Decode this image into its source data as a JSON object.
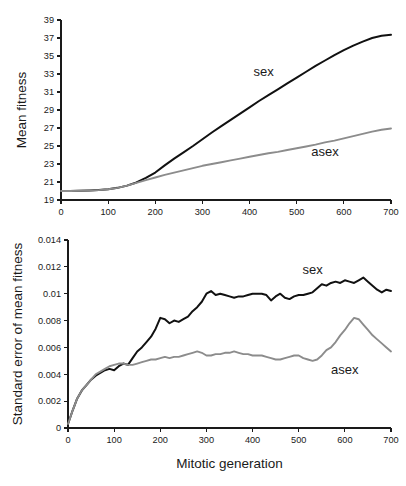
{
  "figure": {
    "name": "mean-fitness-and-standard-error-figure",
    "background_color": "#ffffff",
    "series_colors": {
      "sex": "#111111",
      "asex": "#8c8c8c"
    }
  },
  "chart_data": [
    {
      "panel": "top",
      "type": "line",
      "title": "",
      "xlabel": "",
      "ylabel": "Mean fitness",
      "xlim": [
        0,
        700
      ],
      "ylim": [
        19,
        39
      ],
      "xticks": [
        0,
        100,
        200,
        300,
        400,
        500,
        600,
        700
      ],
      "yticks": [
        19,
        21,
        23,
        25,
        27,
        29,
        31,
        33,
        35,
        37,
        39
      ],
      "xticklabels": [
        "0",
        "100",
        "200",
        "300",
        "400",
        "500",
        "600",
        "700"
      ],
      "yticklabels": [
        "19",
        "21",
        "23",
        "25",
        "27",
        "29",
        "31",
        "33",
        "35",
        "37",
        "39"
      ],
      "grid": false,
      "legend_position": "inline-annotation",
      "annotations": [
        {
          "text": "sex",
          "x": 430,
          "y": 33.2
        },
        {
          "text": "asex",
          "x": 560,
          "y": 24.3
        }
      ],
      "x": [
        0,
        20,
        40,
        60,
        80,
        100,
        120,
        140,
        160,
        180,
        200,
        220,
        240,
        260,
        280,
        300,
        320,
        340,
        360,
        380,
        400,
        420,
        440,
        460,
        480,
        500,
        520,
        540,
        560,
        580,
        600,
        620,
        640,
        660,
        680,
        700
      ],
      "series": [
        {
          "name": "sex",
          "color": "#111111",
          "values": [
            20.0,
            20.0,
            20.02,
            20.05,
            20.1,
            20.2,
            20.35,
            20.6,
            20.95,
            21.45,
            22.05,
            22.85,
            23.6,
            24.3,
            25.0,
            25.75,
            26.5,
            27.2,
            27.9,
            28.6,
            29.3,
            30.0,
            30.65,
            31.3,
            31.95,
            32.6,
            33.25,
            33.9,
            34.5,
            35.1,
            35.65,
            36.15,
            36.6,
            37.0,
            37.25,
            37.35
          ]
        },
        {
          "name": "asex",
          "color": "#8c8c8c",
          "values": [
            20.0,
            20.0,
            20.02,
            20.05,
            20.1,
            20.2,
            20.35,
            20.6,
            20.9,
            21.2,
            21.5,
            21.8,
            22.05,
            22.3,
            22.55,
            22.8,
            23.0,
            23.2,
            23.4,
            23.6,
            23.8,
            24.0,
            24.2,
            24.35,
            24.55,
            24.75,
            24.95,
            25.15,
            25.4,
            25.6,
            25.85,
            26.1,
            26.35,
            26.6,
            26.8,
            26.95
          ]
        }
      ]
    },
    {
      "panel": "bottom",
      "type": "line",
      "title": "",
      "xlabel": "Mitotic generation",
      "ylabel": "Standard error of mean fitness",
      "xlim": [
        0,
        700
      ],
      "ylim": [
        0,
        0.014
      ],
      "xticks": [
        0,
        100,
        200,
        300,
        400,
        500,
        600,
        700
      ],
      "yticks": [
        0,
        0.002,
        0.004,
        0.006,
        0.008,
        0.01,
        0.012,
        0.014
      ],
      "xticklabels": [
        "0",
        "100",
        "200",
        "300",
        "400",
        "500",
        "600",
        "700"
      ],
      "yticklabels": [
        "0",
        "0.002",
        "0.004",
        "0.006",
        "0.008",
        "0.01",
        "0.012",
        "0.014"
      ],
      "grid": false,
      "legend_position": "inline-annotation",
      "annotations": [
        {
          "text": "sex",
          "x": 530,
          "y": 0.01175
        },
        {
          "text": "asex",
          "x": 600,
          "y": 0.00435
        }
      ],
      "x": [
        0,
        10,
        20,
        30,
        40,
        50,
        60,
        70,
        80,
        90,
        100,
        110,
        120,
        130,
        140,
        150,
        160,
        170,
        180,
        190,
        200,
        210,
        220,
        230,
        240,
        250,
        260,
        270,
        280,
        290,
        300,
        310,
        320,
        330,
        340,
        350,
        360,
        370,
        380,
        390,
        400,
        410,
        420,
        430,
        440,
        450,
        460,
        470,
        480,
        490,
        500,
        510,
        520,
        530,
        540,
        550,
        560,
        570,
        580,
        590,
        600,
        610,
        620,
        630,
        640,
        650,
        660,
        670,
        680,
        690,
        700
      ],
      "series": [
        {
          "name": "sex",
          "color": "#111111",
          "values": [
            0.0003,
            0.0013,
            0.0022,
            0.0028,
            0.0032,
            0.0036,
            0.0039,
            0.0041,
            0.0043,
            0.0044,
            0.0043,
            0.0046,
            0.0048,
            0.0047,
            0.0052,
            0.0057,
            0.006,
            0.0064,
            0.0068,
            0.0074,
            0.0082,
            0.0081,
            0.0078,
            0.008,
            0.0079,
            0.0081,
            0.0083,
            0.0087,
            0.009,
            0.0094,
            0.01,
            0.0102,
            0.0099,
            0.01,
            0.0099,
            0.0098,
            0.0097,
            0.0098,
            0.0098,
            0.0099,
            0.01,
            0.01,
            0.01,
            0.0099,
            0.0095,
            0.0098,
            0.01,
            0.0097,
            0.0096,
            0.0098,
            0.0099,
            0.0099,
            0.01,
            0.0101,
            0.0104,
            0.0107,
            0.0106,
            0.0108,
            0.0109,
            0.0108,
            0.011,
            0.0109,
            0.0108,
            0.011,
            0.0112,
            0.0109,
            0.0106,
            0.0103,
            0.0101,
            0.0103,
            0.0102
          ]
        },
        {
          "name": "asex",
          "color": "#8c8c8c",
          "values": [
            0.0003,
            0.0013,
            0.0022,
            0.0028,
            0.0032,
            0.0036,
            0.004,
            0.0042,
            0.0044,
            0.0046,
            0.0047,
            0.0048,
            0.0048,
            0.0047,
            0.0047,
            0.0048,
            0.0049,
            0.005,
            0.0051,
            0.0051,
            0.0052,
            0.0053,
            0.0052,
            0.0053,
            0.0053,
            0.0054,
            0.0055,
            0.0056,
            0.0057,
            0.0056,
            0.0054,
            0.0054,
            0.0055,
            0.0055,
            0.0056,
            0.0056,
            0.0057,
            0.0056,
            0.0055,
            0.0055,
            0.0054,
            0.0054,
            0.0054,
            0.0053,
            0.0052,
            0.0051,
            0.0051,
            0.0052,
            0.0053,
            0.0054,
            0.0054,
            0.0052,
            0.0051,
            0.005,
            0.0051,
            0.0054,
            0.0058,
            0.006,
            0.0064,
            0.0069,
            0.0073,
            0.0078,
            0.0082,
            0.0081,
            0.0077,
            0.0073,
            0.0069,
            0.0066,
            0.0063,
            0.006,
            0.0057
          ]
        }
      ]
    }
  ]
}
